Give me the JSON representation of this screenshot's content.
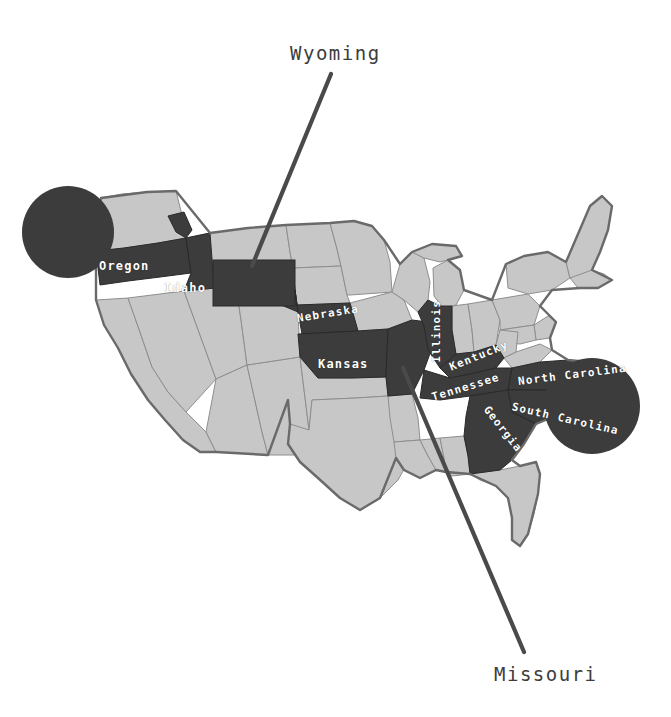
{
  "figure": {
    "kind": "united-states-choropleth-map",
    "background_color": "#ffffff",
    "state_fill_light": "#c7c7c7",
    "state_fill_highlight": "#3c3c3c",
    "state_border_color": "#8e8e8e",
    "outline_color": "#6a6a6a",
    "circle_color": "#3c3c3c",
    "leader_line_color": "#4a4a4a",
    "label_color_external": "#3d3d3d",
    "label_color_state": "#ffffff"
  },
  "external_labels": [
    {
      "id": "wyoming",
      "text": "Wyoming",
      "x": 290,
      "y": 42,
      "leader_line": {
        "x1": 331,
        "y1": 74,
        "x2": 252,
        "y2": 266
      }
    },
    {
      "id": "missouri",
      "text": "Missouri",
      "x": 494,
      "y": 663,
      "leader_line": {
        "x1": 403,
        "y1": 368,
        "x2": 524,
        "y2": 652
      }
    }
  ],
  "highlighted_states": [
    {
      "name": "Oregon",
      "label_x": 99,
      "label_y": 259,
      "rotation": 0,
      "font_size": 12
    },
    {
      "name": "Idaho",
      "label_x": 164,
      "label_y": 281,
      "rotation": 0,
      "font_size": 12
    },
    {
      "name": "Wyoming",
      "label_x": 0,
      "label_y": 0,
      "rotation": 0,
      "font_size": 0,
      "labeled_externally": true
    },
    {
      "name": "Nebraska",
      "label_x": 297,
      "label_y": 312,
      "rotation": -9,
      "font_size": 11
    },
    {
      "name": "Kansas",
      "label_x": 318,
      "label_y": 357,
      "rotation": 0,
      "font_size": 12
    },
    {
      "name": "Missouri",
      "label_x": 0,
      "label_y": 0,
      "rotation": 0,
      "font_size": 0,
      "labeled_externally": true
    },
    {
      "name": "Illinois",
      "label_x": 436,
      "label_y": 356,
      "rotation": -90,
      "font_size": 11
    },
    {
      "name": "Kentucky",
      "label_x": 450,
      "label_y": 361,
      "rotation": -22,
      "font_size": 11
    },
    {
      "name": "Tennessee",
      "label_x": 432,
      "label_y": 391,
      "rotation": -17,
      "font_size": 11
    },
    {
      "name": "North Carolina",
      "label_x": 518,
      "label_y": 375,
      "rotation": -7,
      "font_size": 11
    },
    {
      "name": "South Carolina",
      "label_x": 512,
      "label_y": 400,
      "rotation": 13,
      "font_size": 11
    },
    {
      "name": "Georgia",
      "label_x": 486,
      "label_y": 401,
      "rotation": 52,
      "font_size": 11
    }
  ],
  "annotation_circles": [
    {
      "id": "northwest-circle",
      "cx": 68,
      "cy": 232,
      "r": 46
    },
    {
      "id": "southeast-circle",
      "cx": 592,
      "cy": 406,
      "r": 48
    }
  ]
}
